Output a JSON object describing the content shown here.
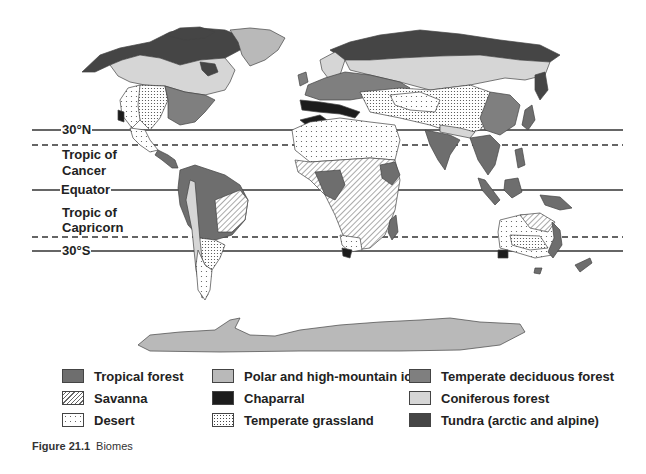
{
  "figure": {
    "number_label": "Figure 21.1",
    "title": "Biomes"
  },
  "latitude_lines": [
    {
      "label": "30°N",
      "style": "solid",
      "y": 130
    },
    {
      "label": "Tropic of Cancer",
      "style": "dashed",
      "y": 145
    },
    {
      "label": "Equator",
      "style": "solid",
      "y": 190
    },
    {
      "label": "Tropic of Capricorn",
      "style": "dashed",
      "y": 237
    },
    {
      "label": "30°S",
      "style": "solid",
      "y": 251
    }
  ],
  "labels": {
    "n30": "30°N",
    "cancer_line1": "Tropic of",
    "cancer_line2": "Cancer",
    "equator": "Equator",
    "capricorn_line1": "Tropic of",
    "capricorn_line2": "Capricorn",
    "s30": "30°S"
  },
  "legend": {
    "items": [
      {
        "label": "Tropical forest",
        "fill": "#6e6e6e",
        "pattern": "solid"
      },
      {
        "label": "Savanna",
        "fill": "#ffffff",
        "pattern": "diagonal-hatch"
      },
      {
        "label": "Desert",
        "fill": "#ffffff",
        "pattern": "sparse-dots"
      },
      {
        "label": "Polar and high-mountain ice",
        "fill": "#b9b9b9",
        "pattern": "solid"
      },
      {
        "label": "Chaparral",
        "fill": "#1c1c1c",
        "pattern": "solid"
      },
      {
        "label": "Temperate grassland",
        "fill": "#ffffff",
        "pattern": "dense-dots"
      },
      {
        "label": "Temperate deciduous forest",
        "fill": "#7f7f7f",
        "pattern": "solid"
      },
      {
        "label": "Coniferous forest",
        "fill": "#d6d6d6",
        "pattern": "solid"
      },
      {
        "label": "Tundra (arctic and alpine)",
        "fill": "#454545",
        "pattern": "solid"
      }
    ]
  },
  "colors": {
    "tropical": "#6e6e6e",
    "ice": "#b9b9b9",
    "chaparral": "#1c1c1c",
    "deciduous": "#7f7f7f",
    "coniferous": "#d6d6d6",
    "tundra": "#454545",
    "line": "#333333"
  }
}
